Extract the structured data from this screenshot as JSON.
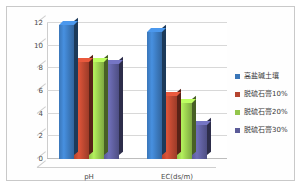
{
  "chart_data": {
    "type": "bar",
    "title": "",
    "xlabel": "",
    "ylabel": "",
    "categories": [
      "pH",
      "EC(ds/m)"
    ],
    "series": [
      {
        "name": "高盐碱土壤",
        "color": "#3a76b8",
        "values": [
          11.8,
          11.2
        ]
      },
      {
        "name": "脱硫石膏10%",
        "color": "#b5452f",
        "values": [
          8.6,
          5.6
        ]
      },
      {
        "name": "脱硫石膏20%",
        "color": "#93c54b",
        "values": [
          8.6,
          4.9
        ]
      },
      {
        "name": "脱硫石膏30%",
        "color": "#5b5b98",
        "values": [
          8.4,
          3.0
        ]
      }
    ],
    "ylim": [
      0,
      12
    ],
    "yticks": [
      0,
      2,
      4,
      6,
      8,
      10,
      12
    ],
    "ytick_labels": [
      "0",
      "2",
      "4",
      "6",
      "8",
      "10",
      "12"
    ],
    "grid": true,
    "legend_position": "right",
    "three_d": true
  },
  "legend": {
    "entries": [
      {
        "label": "高盐碱土壤",
        "color": "#3a76b8"
      },
      {
        "label": "脱硫石膏10%",
        "color": "#b5452f"
      },
      {
        "label": "脱硫石膏20%",
        "color": "#93c54b"
      },
      {
        "label": "脱硫石膏30%",
        "color": "#5b5b98"
      }
    ]
  }
}
